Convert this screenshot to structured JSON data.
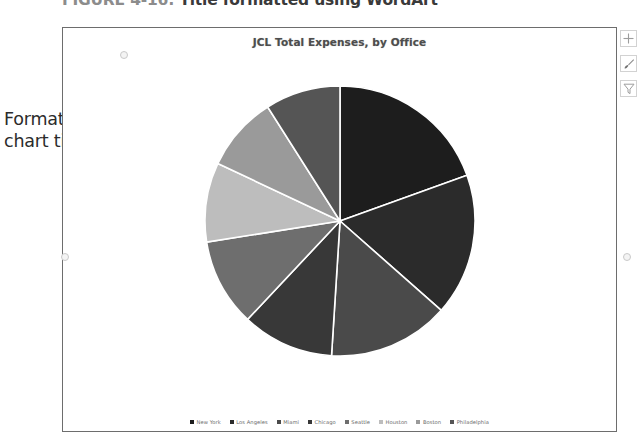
{
  "figure": {
    "caption_number": "FIGURE 4-16:",
    "caption_text": "Title formatted using WordArt"
  },
  "annotation": {
    "line1": "Formatted",
    "line2": "chart title",
    "arrow": "callout-arrow"
  },
  "chart": {
    "title": "JCL Total Expenses, by Office",
    "selection_handles": [
      "top-middle",
      "left-middle",
      "right-middle"
    ]
  },
  "side_buttons": [
    {
      "name": "chart-elements",
      "icon": "plus-icon"
    },
    {
      "name": "chart-styles",
      "icon": "paintbrush-icon"
    },
    {
      "name": "chart-filters",
      "icon": "funnel-icon"
    }
  ],
  "chart_data": {
    "type": "pie",
    "title": "JCL Total Expenses, by Office",
    "xlabel": "",
    "ylabel": "",
    "legend_position": "bottom",
    "grid": false,
    "categories": [
      "New York",
      "Los Angeles",
      "Miami",
      "Chicago",
      "Seattle",
      "Houston",
      "Boston",
      "Philadelphia"
    ],
    "values": [
      19.5,
      17.0,
      14.5,
      11.0,
      10.5,
      9.5,
      9.0,
      9.0
    ],
    "colors": [
      "#1d1d1d",
      "#2b2b2b",
      "#4a4a4a",
      "#383838",
      "#6e6e6e",
      "#bdbdbd",
      "#9a9a9a",
      "#555555"
    ],
    "slice_angles_deg": [
      70.2,
      61.2,
      52.2,
      39.6,
      37.8,
      34.2,
      32.4,
      32.4
    ],
    "start_angle_deg": 0,
    "separator_color": "#ffffff"
  }
}
